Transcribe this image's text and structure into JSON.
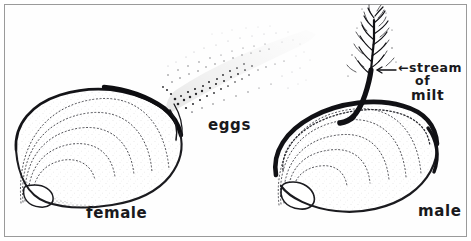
{
  "figure": {
    "medium": "pen-and-ink stipple drawing",
    "frame_color": "#9a9a9a",
    "ink_color": "#19191c",
    "paper_color": "#fefefe"
  },
  "labels": {
    "female": "female",
    "male": "male",
    "eggs": "eggs",
    "milt_line1": "←stream",
    "milt_line2": "of",
    "milt_line3": "milt"
  },
  "subjects": [
    {
      "name": "female-shell",
      "label": "female",
      "emission": "eggs",
      "emission_style": "diffuse stippled cloud",
      "position": "left",
      "growth_lines": 5
    },
    {
      "name": "male-shell",
      "label": "male",
      "emission": "stream of milt",
      "emission_style": "dense feathery branching plume",
      "position": "right",
      "growth_lines": 5
    }
  ]
}
